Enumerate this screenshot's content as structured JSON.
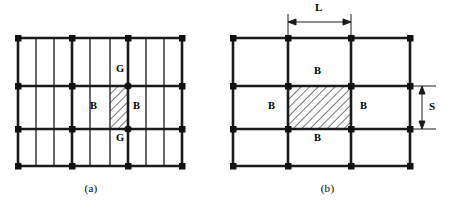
{
  "figure": {
    "stroke_color": "#1a1a1a",
    "hatch_color": "#4d4d4d",
    "background": "#ffffff"
  },
  "panels": [
    {
      "id": "a",
      "caption": "(a)",
      "description": "Framing plan with closely spaced secondary beams (joists) between girders",
      "grid": {
        "thick_columns_x": [
          18,
          72,
          128,
          182
        ],
        "thin_columns_x": [
          36,
          54,
          90,
          110,
          146,
          164
        ],
        "thick_rows_y": [
          38,
          86,
          129,
          166
        ],
        "node_size": 6
      },
      "hatched_cell": {
        "x": 110,
        "y": 86,
        "width": 18,
        "height": 43
      },
      "labels": [
        {
          "text": "G",
          "name": "label-girder-top",
          "x": 116,
          "y": 70
        },
        {
          "text": "G",
          "name": "label-girder-bottom",
          "x": 116,
          "y": 138
        },
        {
          "text": "B",
          "name": "label-beam-left",
          "x": 93,
          "y": 102
        },
        {
          "text": "B",
          "name": "label-beam-right",
          "x": 134,
          "y": 102
        }
      ]
    },
    {
      "id": "b",
      "caption": "(b)",
      "description": "Framing plan with widely spaced beams forming a large bay panel",
      "grid": {
        "columns_x": [
          7,
          62,
          125,
          184
        ],
        "rows_y": [
          38,
          86,
          129,
          166
        ],
        "node_size": 6
      },
      "hatched_cell": {
        "x": 62,
        "y": 86,
        "width": 63,
        "height": 43
      },
      "labels": [
        {
          "text": "B",
          "name": "label-beam-top",
          "x": 90,
          "y": 72
        },
        {
          "text": "B",
          "name": "label-beam-bottom",
          "x": 90,
          "y": 138
        },
        {
          "text": "B",
          "name": "label-beam-left",
          "x": 44,
          "y": 102
        },
        {
          "text": "B",
          "name": "label-beam-right",
          "x": 135,
          "y": 102
        }
      ],
      "dimensions": [
        {
          "symbol": "L",
          "name": "dimension-span-l",
          "orientation": "horizontal",
          "from": 62,
          "to": 125,
          "axis_pos": 20,
          "label_x": 88,
          "label_y": 3,
          "meaning": "beam span between columns"
        },
        {
          "symbol": "S",
          "name": "dimension-spacing-s",
          "orientation": "vertical",
          "from": 86,
          "to": 129,
          "axis_pos": 196,
          "label_x": 202,
          "label_y": 100,
          "meaning": "beam spacing"
        }
      ]
    }
  ],
  "legend_keys": {
    "G": "girder",
    "B": "beam",
    "L": "span length",
    "S": "spacing"
  }
}
